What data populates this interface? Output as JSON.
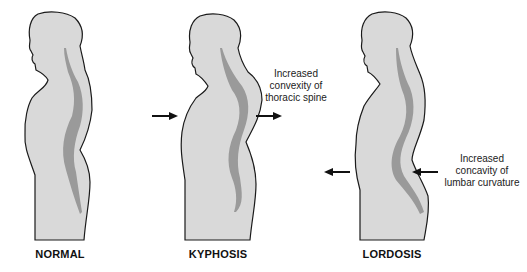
{
  "figure": {
    "panels": [
      {
        "id": "normal",
        "label": "NORMAL"
      },
      {
        "id": "kyphosis",
        "label": "KYPHOSIS"
      },
      {
        "id": "lordosis",
        "label": "LORDOSIS"
      }
    ],
    "annotations": {
      "kyphosis": {
        "line1": "Increased",
        "line2": "convexity of",
        "line3": "thoracic spine"
      },
      "lordosis": {
        "line1": "Increased",
        "line2": "concavity of",
        "line3": "lumbar curvature"
      }
    },
    "arrows": [
      {
        "panel": "kyphosis",
        "direction": "right",
        "position": "front"
      },
      {
        "panel": "kyphosis",
        "direction": "right",
        "position": "back"
      },
      {
        "panel": "lordosis",
        "direction": "left",
        "position": "front"
      },
      {
        "panel": "lordosis",
        "direction": "left",
        "position": "back"
      }
    ],
    "colors": {
      "body_fill": "#d9d9d9",
      "body_outline": "#1a1a1a",
      "spine_fill": "#9a9a9a",
      "arrow": "#111111",
      "background": "#ffffff"
    }
  }
}
